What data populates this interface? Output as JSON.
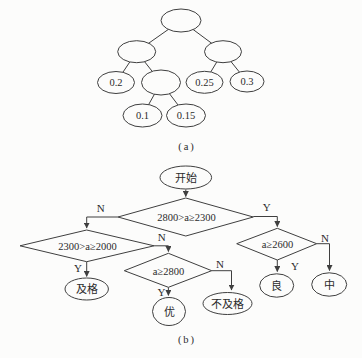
{
  "figure": {
    "panel_a": {
      "caption": "(a)",
      "tree": {
        "nodes": [
          {
            "id": "root",
            "label": ""
          },
          {
            "id": "left-child",
            "label": ""
          },
          {
            "id": "right-child",
            "label": ""
          },
          {
            "id": "leaf-02",
            "label": "0.2"
          },
          {
            "id": "internal-mid",
            "label": ""
          },
          {
            "id": "leaf-025",
            "label": "0.25"
          },
          {
            "id": "leaf-03",
            "label": "0.3"
          },
          {
            "id": "leaf-01",
            "label": "0.1"
          },
          {
            "id": "leaf-015",
            "label": "0.15"
          }
        ],
        "edges": [
          [
            "root",
            "left-child"
          ],
          [
            "root",
            "right-child"
          ],
          [
            "left-child",
            "leaf-02"
          ],
          [
            "left-child",
            "internal-mid"
          ],
          [
            "right-child",
            "leaf-025"
          ],
          [
            "right-child",
            "leaf-03"
          ],
          [
            "internal-mid",
            "leaf-01"
          ],
          [
            "internal-mid",
            "leaf-015"
          ]
        ]
      }
    },
    "panel_b": {
      "caption": "(b)",
      "flowchart": {
        "start_label": "开始",
        "decisions": [
          {
            "id": "d1",
            "label": "2800>a≥2300"
          },
          {
            "id": "d2",
            "label": "2300>a≥2000"
          },
          {
            "id": "d3",
            "label": "a≥2800"
          },
          {
            "id": "d4",
            "label": "a≥2600"
          }
        ],
        "terminals": [
          {
            "id": "pass",
            "label": "及格"
          },
          {
            "id": "excellent",
            "label": "优"
          },
          {
            "id": "fail",
            "label": "不及格"
          },
          {
            "id": "good",
            "label": "良"
          },
          {
            "id": "medium",
            "label": "中"
          }
        ],
        "branch_labels": {
          "yes": "Y",
          "no": "N"
        }
      }
    }
  },
  "colors": {
    "background": "#fcfcfb",
    "line": "#3f3f3f",
    "text": "#2b2b2b"
  }
}
